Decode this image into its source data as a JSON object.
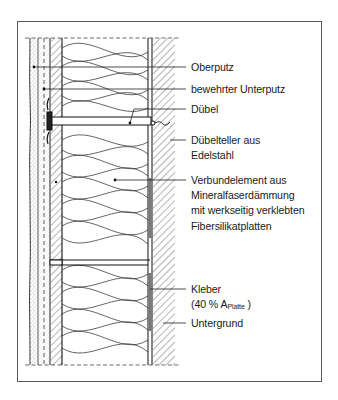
{
  "figure": {
    "type": "section-detail",
    "colors": {
      "line": "#1a1a1a",
      "frame": "#5a5a5a",
      "background": "#ffffff"
    }
  },
  "labels": {
    "oberputz": "Oberputz",
    "unterputz": "bewehrter Unterputz",
    "duebel": "Dübel",
    "duebelteller_1": "Dübelteller aus",
    "duebelteller_2": "Edelstahl",
    "verbund_1": "Verbundelement aus",
    "verbund_2": "Mineralfaserdämmung",
    "verbund_3": "mit werkseitig verklebten",
    "verbund_4": "Fibersilikatplatten",
    "kleber_1": "Kleber",
    "kleber_2_pre": "(40 % A",
    "kleber_2_sub": "Platte",
    "kleber_2_post": " )",
    "untergrund": "Untergrund"
  }
}
